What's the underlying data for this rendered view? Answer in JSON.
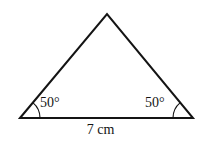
{
  "figure": {
    "kind": "geometry-diagram",
    "shape": "isosceles-triangle",
    "background_color": "#ffffff",
    "stroke_color": "#141414",
    "text_color": "#141414",
    "stroke_width": 2,
    "arc_stroke_width": 1.2
  },
  "labels": {
    "angle_left": "50°",
    "angle_right": "50°",
    "base_length": "7 cm"
  },
  "chart_data": {
    "type": "diagram",
    "title": "",
    "shape": "triangle",
    "vertices": [
      {
        "name": "apex",
        "x": 107,
        "y": 14
      },
      {
        "name": "bottom-left",
        "x": 20,
        "y": 118
      },
      {
        "name": "bottom-right",
        "x": 193,
        "y": 118
      }
    ],
    "sides": [
      {
        "name": "base",
        "from": "bottom-left",
        "to": "bottom-right",
        "label": "7 cm",
        "value": 7,
        "unit": "cm"
      },
      {
        "name": "left-leg",
        "from": "bottom-left",
        "to": "apex",
        "label": "",
        "value": null,
        "unit": ""
      },
      {
        "name": "right-leg",
        "from": "bottom-right",
        "to": "apex",
        "label": "",
        "value": null,
        "unit": ""
      }
    ],
    "angles": [
      {
        "at": "bottom-left",
        "label": "50°",
        "value": 50,
        "unit": "degrees",
        "marked": true
      },
      {
        "at": "bottom-right",
        "label": "50°",
        "value": 50,
        "unit": "degrees",
        "marked": true
      },
      {
        "at": "apex",
        "label": "",
        "value": 80,
        "unit": "degrees",
        "marked": false
      }
    ],
    "annotations": [
      "50°",
      "50°",
      "7 cm"
    ]
  },
  "geometry": {
    "apex_x": 107,
    "apex_y": 14,
    "left_x": 20,
    "left_y": 118,
    "right_x": 193,
    "right_y": 118,
    "arc_radius": 20
  }
}
